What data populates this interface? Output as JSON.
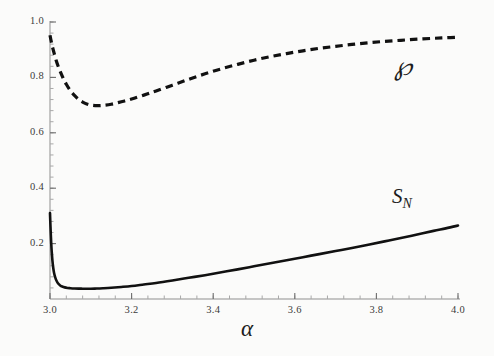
{
  "figure": {
    "background_color": "#fbfbfa",
    "width": 494,
    "height": 356,
    "axis_label_x": "α"
  },
  "labels": {
    "rho": "℘",
    "sn_base": "S",
    "sn_sub": "N"
  },
  "chart_data": {
    "type": "line",
    "title": "",
    "subtitle": "",
    "xlabel": "α",
    "ylabel": "",
    "xlim": [
      3.0,
      4.0
    ],
    "ylim": [
      0.0,
      1.0
    ],
    "grid": false,
    "legend_position": "inline-annotation",
    "xticks": [
      3.0,
      3.2,
      3.4,
      3.6,
      3.8,
      4.0
    ],
    "xtick_labels": [
      "3.0",
      "3.2",
      "3.4",
      "3.6",
      "3.8",
      "4.0"
    ],
    "yticks": [
      0.2,
      0.4,
      0.6,
      0.8,
      1.0
    ],
    "ytick_labels": [
      "0.2",
      "0.4",
      "0.6",
      "0.8",
      "1.0"
    ],
    "minor_tick_step_x": 0.04,
    "minor_tick_step_y": 0.04,
    "annotations": [
      {
        "text": "℘",
        "x": 3.88,
        "y": 0.84
      },
      {
        "text": "S_N",
        "x": 3.86,
        "y": 0.37
      }
    ],
    "series": [
      {
        "name": "℘",
        "style": "dashed",
        "color": "#111111",
        "linewidth": 3.2,
        "x": [
          3.0,
          3.003,
          3.006,
          3.01,
          3.015,
          3.02,
          3.026,
          3.032,
          3.04,
          3.05,
          3.06,
          3.07,
          3.08,
          3.09,
          3.1,
          3.115,
          3.13,
          3.15,
          3.175,
          3.2,
          3.23,
          3.26,
          3.3,
          3.34,
          3.38,
          3.42,
          3.46,
          3.5,
          3.54,
          3.58,
          3.62,
          3.66,
          3.7,
          3.74,
          3.78,
          3.82,
          3.86,
          3.9,
          3.94,
          3.97,
          4.0
        ],
        "y": [
          0.952,
          0.93,
          0.91,
          0.888,
          0.862,
          0.84,
          0.818,
          0.798,
          0.775,
          0.752,
          0.735,
          0.721,
          0.711,
          0.704,
          0.7,
          0.698,
          0.699,
          0.703,
          0.712,
          0.722,
          0.736,
          0.751,
          0.772,
          0.793,
          0.813,
          0.831,
          0.847,
          0.862,
          0.875,
          0.886,
          0.896,
          0.905,
          0.912,
          0.919,
          0.925,
          0.93,
          0.934,
          0.938,
          0.941,
          0.943,
          0.945
        ]
      },
      {
        "name": "S_N",
        "style": "solid",
        "color": "#111111",
        "linewidth": 2.6,
        "x": [
          3.0,
          3.001,
          3.002,
          3.003,
          3.004,
          3.006,
          3.008,
          3.01,
          3.013,
          3.016,
          3.02,
          3.025,
          3.03,
          3.036,
          3.043,
          3.05,
          3.06,
          3.07,
          3.08,
          3.09,
          3.1,
          3.115,
          3.13,
          3.15,
          3.175,
          3.2,
          3.23,
          3.26,
          3.3,
          3.34,
          3.38,
          3.42,
          3.46,
          3.5,
          3.54,
          3.58,
          3.62,
          3.66,
          3.7,
          3.74,
          3.78,
          3.82,
          3.86,
          3.9,
          3.94,
          3.97,
          4.0
        ],
        "y": [
          0.31,
          0.268,
          0.232,
          0.201,
          0.176,
          0.138,
          0.112,
          0.094,
          0.077,
          0.066,
          0.056,
          0.049,
          0.045,
          0.042,
          0.04,
          0.039,
          0.038,
          0.0375,
          0.0372,
          0.037,
          0.0372,
          0.0378,
          0.0388,
          0.0405,
          0.0435,
          0.047,
          0.0525,
          0.058,
          0.067,
          0.0765,
          0.086,
          0.0965,
          0.107,
          0.118,
          0.129,
          0.14,
          0.151,
          0.162,
          0.173,
          0.184,
          0.196,
          0.208,
          0.22,
          0.233,
          0.246,
          0.255,
          0.265
        ]
      }
    ]
  },
  "geometry": {
    "left": 50,
    "right": 458,
    "bottom": 299,
    "top": 22,
    "y_value_at_bottom": 0.0,
    "y_value_at_top": 1.0
  }
}
